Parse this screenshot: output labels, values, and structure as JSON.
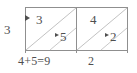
{
  "figure": {
    "type": "lattice-multiplication-diagram",
    "left_multiplicand": "3",
    "cells": [
      {
        "top_digit": "3",
        "bottom_digit": "5",
        "column_sum": "4+5=9"
      },
      {
        "top_digit": "4",
        "bottom_digit": "2",
        "column_sum": "2"
      }
    ],
    "bottom_labels": {
      "left": "4+5=9",
      "right": "2"
    },
    "colors": {
      "ink": "#4f4f4f",
      "grid": "#8c8c8c",
      "diagonal": "#b8b8b8",
      "background": "#ffffff"
    },
    "icons": {
      "carry_arrow": "carry-arrow-icon"
    }
  }
}
